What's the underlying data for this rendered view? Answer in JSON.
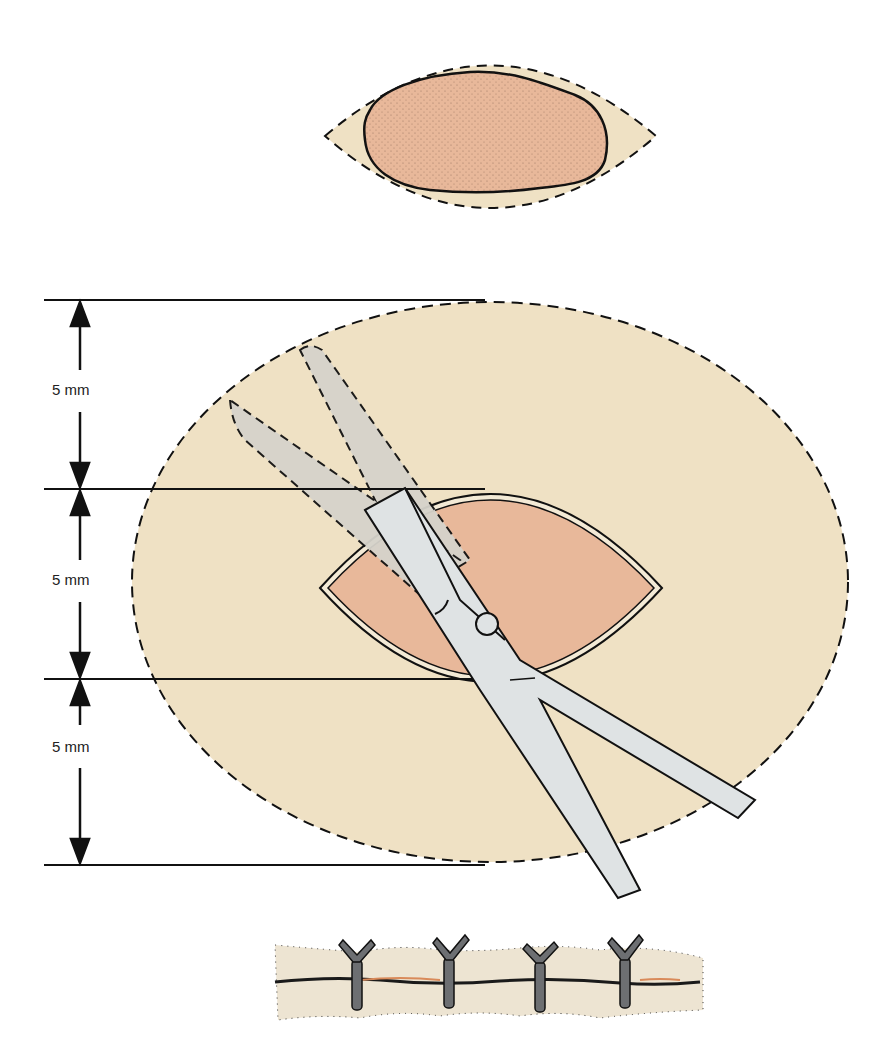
{
  "diagram": {
    "panels": [
      {
        "id": "lesion",
        "description": "Elliptical excision outline around irregular pigmented lesion"
      },
      {
        "id": "excision",
        "description": "Elliptical undermining area with scissors and margin measurements"
      },
      {
        "id": "closure",
        "description": "Closed wound with interrupted sutures"
      }
    ],
    "measurements": [
      {
        "label": "5 mm"
      },
      {
        "label": "5 mm"
      },
      {
        "label": "5 mm"
      }
    ],
    "suture_count": 4,
    "colors": {
      "skin": "#efe1c4",
      "lesion": "#e8b89a",
      "instrument": "#dfe3e4",
      "instrument_shadow": "#d6d3cb",
      "suture": "#6d6f72",
      "outline": "#111111",
      "wound_line": "#d98a5a"
    }
  }
}
